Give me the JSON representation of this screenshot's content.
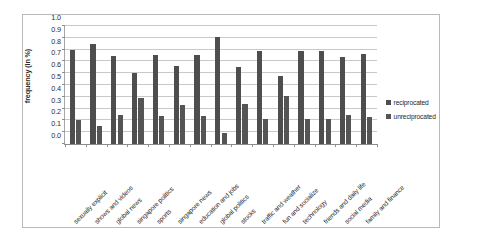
{
  "chart_data": {
    "type": "bar",
    "title": "",
    "xlabel": "",
    "ylabel": "frequency (in %)",
    "ylim": [
      0.0,
      1.0
    ],
    "ytick_labels": [
      "1.0",
      "0.9",
      "0.8",
      "0.7",
      "0.6",
      "0.5",
      "0.4",
      "0.3",
      "0.2",
      "0.1",
      "0.0"
    ],
    "ytick_values": [
      1.0,
      0.9,
      0.8,
      0.7,
      0.6,
      0.5,
      0.4,
      0.3,
      0.2,
      0.1,
      0.0
    ],
    "grid": true,
    "legend_position": "right",
    "categories": [
      "sexually explicit",
      "shows and videos",
      "global news",
      "singapore politics",
      "sports",
      "singapore news",
      "education and jobs",
      "global politics",
      "stocks",
      "traffic and weather",
      "fun and socialize",
      "technology",
      "friends and daily life",
      "social media",
      "family and finance"
    ],
    "series": [
      {
        "name": "reciprocated",
        "color": "#4e4e4e",
        "values": [
          0.8,
          0.85,
          0.75,
          0.6,
          0.755,
          0.665,
          0.755,
          0.905,
          0.655,
          0.785,
          0.58,
          0.785,
          0.785,
          0.74,
          0.76
        ]
      },
      {
        "name": "unreciprocated",
        "color": "#555555",
        "values": [
          0.2,
          0.15,
          0.245,
          0.39,
          0.24,
          0.33,
          0.24,
          0.09,
          0.335,
          0.21,
          0.41,
          0.21,
          0.21,
          0.25,
          0.23
        ]
      }
    ]
  }
}
